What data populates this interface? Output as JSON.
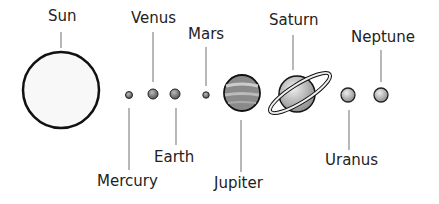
{
  "diagram": {
    "planets": [
      {
        "name": "Sun"
      },
      {
        "name": "Mercury"
      },
      {
        "name": "Venus"
      },
      {
        "name": "Earth"
      },
      {
        "name": "Mars"
      },
      {
        "name": "Jupiter"
      },
      {
        "name": "Saturn"
      },
      {
        "name": "Uranus"
      },
      {
        "name": "Neptune"
      }
    ]
  }
}
